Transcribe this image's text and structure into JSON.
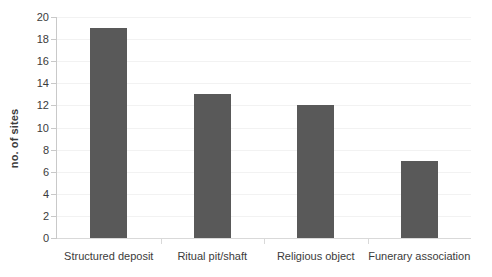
{
  "chart_data": {
    "type": "bar",
    "title": "",
    "subtitle": "",
    "xlabel": "",
    "ylabel": "no. of sites",
    "categories": [
      "Structured deposit",
      "Ritual pit/shaft",
      "Religious object",
      "Funerary association"
    ],
    "values": [
      19,
      13,
      12,
      7
    ],
    "series": [
      {
        "name": "no. of sites",
        "values": [
          19,
          13,
          12,
          7
        ]
      }
    ],
    "ylim": [
      0,
      20
    ],
    "y_ticks": [
      0,
      2,
      4,
      6,
      8,
      10,
      12,
      14,
      16,
      18,
      20
    ],
    "y_tick_labels": [
      "0",
      "2",
      "4",
      "6",
      "8",
      "10",
      "12",
      "14",
      "16",
      "18",
      "20"
    ],
    "grid": true,
    "grid_axis": "y",
    "legend": false,
    "legend_position": "none",
    "annotations": [],
    "colors": {
      "bar_fill": "#595959",
      "gridline": "#f2f2f2",
      "axis_line": "#c9c9c9",
      "baseline": "#d9d9d9",
      "text": "#3b3b3b",
      "background": "#ffffff"
    }
  }
}
